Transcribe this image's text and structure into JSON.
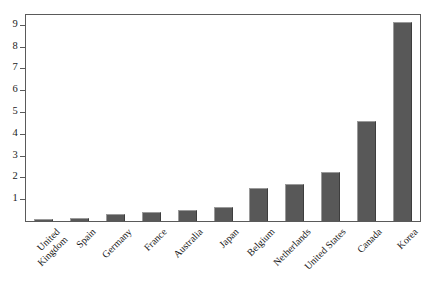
{
  "chart_data": {
    "type": "bar",
    "title": "",
    "subtitle": "",
    "xlabel": "",
    "ylabel": "",
    "categories": [
      "United Kingdom",
      "Spain",
      "Germany",
      "France",
      "Australia",
      "Japan",
      "Belgium",
      "Netherlands",
      "United States",
      "Canada",
      "Korea"
    ],
    "values": [
      0.1,
      0.15,
      0.3,
      0.4,
      0.5,
      0.65,
      1.5,
      1.7,
      2.25,
      4.6,
      9.15
    ],
    "ylim": [
      0,
      9.45
    ],
    "yticks": [
      1,
      2,
      3,
      4,
      5,
      6,
      7,
      8,
      9
    ],
    "ytick_labels": [
      "1",
      "2",
      "3",
      "4",
      "5",
      "6",
      "7",
      "8",
      "9"
    ],
    "grid": false,
    "legend": null,
    "legend_position": "none",
    "bar_color": "#585858",
    "axis_color": "#5a5a5a",
    "background": "#ffffff"
  },
  "x_axis_labels": [
    {
      "line1": "United",
      "line2": "Kingdom"
    },
    {
      "line1": "Spain",
      "line2": ""
    },
    {
      "line1": "Germany",
      "line2": ""
    },
    {
      "line1": "France",
      "line2": ""
    },
    {
      "line1": "Australia",
      "line2": ""
    },
    {
      "line1": "Japan",
      "line2": ""
    },
    {
      "line1": "Belgium",
      "line2": ""
    },
    {
      "line1": "Netherlands",
      "line2": ""
    },
    {
      "line1": "United States",
      "line2": ""
    },
    {
      "line1": "Canada",
      "line2": ""
    },
    {
      "line1": "Korea",
      "line2": ""
    }
  ]
}
